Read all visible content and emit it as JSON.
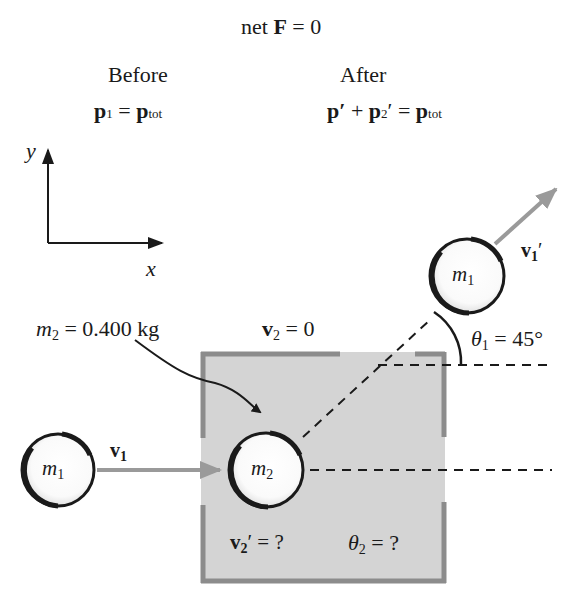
{
  "header": {
    "condition": {
      "prefix": "net ",
      "F": "F",
      "rest": " = 0"
    },
    "before": {
      "title": "Before",
      "eq": {
        "p": "p",
        "sub": "1",
        "eq": " = ",
        "ptot": "p",
        "tot": "tot"
      }
    },
    "after": {
      "title": "After",
      "eq": {
        "p1": "p′",
        "plus": " + ",
        "p2": "p",
        "sub2": "2",
        "prime": "′",
        "eq": " = ",
        "ptot": "p",
        "tot": "tot"
      }
    }
  },
  "axes": {
    "y_label": "y",
    "x_label": "x"
  },
  "objects": {
    "m1_before": {
      "m": "m",
      "sub": "1"
    },
    "m2": {
      "m": "m",
      "sub": "2"
    },
    "m1_after": {
      "m": "m",
      "sub": "1"
    }
  },
  "labels": {
    "v1": {
      "v": "v",
      "sub": "1"
    },
    "v1_prime": {
      "v": "v",
      "sub": "1",
      "prime": "′"
    },
    "m2_mass": {
      "m": "m",
      "sub": "2",
      "rest": " = 0.400 kg"
    },
    "v2": {
      "v": "v",
      "sub": "2",
      "rest": " = 0"
    },
    "theta1": {
      "theta": "θ",
      "sub": "1",
      "rest": " = 45°"
    },
    "v2_prime": {
      "v": "v",
      "sub": "2",
      "prime": "′",
      "rest": " = ?"
    },
    "theta2": {
      "theta": "θ",
      "sub": "2",
      "rest": " = ?"
    }
  },
  "colors": {
    "box_fill": "#d4d4d4",
    "box_wall": "#8c8c8c",
    "arrow_gray": "#9a9a9a",
    "ink": "#1a1a1a"
  }
}
